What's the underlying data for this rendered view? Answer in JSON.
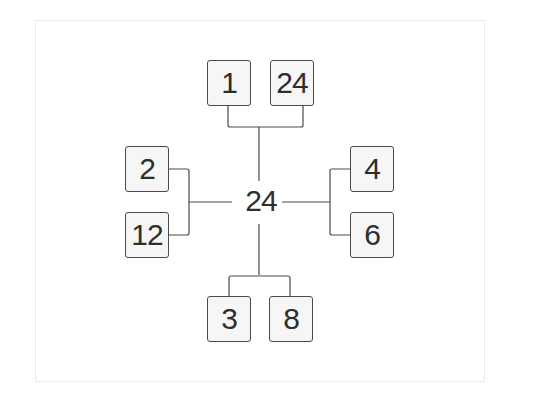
{
  "diagram": {
    "type": "factor-tree",
    "center": {
      "value": "24"
    },
    "branches": {
      "top": [
        {
          "value": "1"
        },
        {
          "value": "24"
        }
      ],
      "left": [
        {
          "value": "2"
        },
        {
          "value": "12"
        }
      ],
      "right": [
        {
          "value": "4"
        },
        {
          "value": "6"
        }
      ],
      "bottom": [
        {
          "value": "3"
        },
        {
          "value": "8"
        }
      ]
    },
    "colors": {
      "line": "#4a4a4a",
      "box_fill": "#f6f6f6",
      "text": "#2e2e2e"
    }
  }
}
